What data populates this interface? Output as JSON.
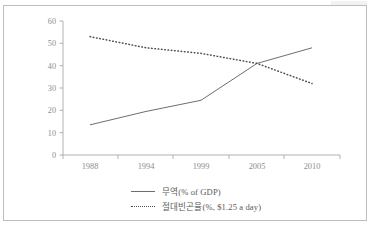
{
  "chart_data": {
    "type": "line",
    "title": "",
    "xlabel": "",
    "ylabel": "",
    "categories": [
      "1988",
      "1994",
      "1999",
      "2005",
      "2010"
    ],
    "ylim": [
      0,
      60
    ],
    "yticks": [
      "0",
      "10",
      "20",
      "30",
      "40",
      "50",
      "60"
    ],
    "grid": false,
    "legend_position": "bottom",
    "series": [
      {
        "name": "무역(% of GDP)",
        "style": "solid",
        "color": "#6e6e6e",
        "values": [
          13.5,
          19.5,
          24.5,
          41,
          48
        ]
      },
      {
        "name": "절대빈곤율(%, $1.25 a day)",
        "style": "dotted",
        "color": "#4d4d4d",
        "values": [
          53,
          48,
          45.5,
          41,
          32
        ]
      }
    ]
  },
  "legend": {
    "items": [
      {
        "label": "무역(% of GDP)",
        "marker": "solid-line-icon"
      },
      {
        "label": "절대빈곤율(%, $1.25 a day)",
        "marker": "dotted-line-icon"
      }
    ]
  },
  "axes": {
    "y_ticks": [
      "60",
      "50",
      "40",
      "30",
      "20",
      "10",
      "0"
    ],
    "x_ticks": [
      "1988",
      "1994",
      "1999",
      "2005",
      "2010"
    ]
  },
  "colors": {
    "series_trade": "#6e6e6e",
    "series_poverty": "#4d4d4d",
    "axis": "#a8a8a8",
    "text": "#8d8d8d",
    "frame": "#bdbdbd",
    "background": "#ffffff"
  }
}
